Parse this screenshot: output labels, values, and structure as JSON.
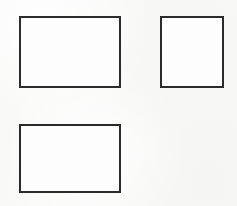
{
  "canvas": {
    "width": 237,
    "height": 206,
    "background_color": "#f8f8f7",
    "description": "Three empty outlined rectangles on a plain off-white background"
  },
  "style": {
    "stroke_color": "#2b2b2b",
    "fill_color": "#fdfdfd",
    "stroke_width_px": 2
  },
  "shapes": [
    {
      "name": "rectangle-top-left",
      "label": "Rectangle 1",
      "x": 19,
      "y": 16,
      "width": 102,
      "height": 72,
      "orientation": "landscape",
      "fill": "#fdfdfd",
      "stroke": "#2b2b2b",
      "stroke_width": 2
    },
    {
      "name": "rectangle-top-right",
      "label": "Rectangle 2",
      "x": 160,
      "y": 16,
      "width": 64,
      "height": 72,
      "orientation": "portrait",
      "fill": "#fdfdfd",
      "stroke": "#2b2b2b",
      "stroke_width": 2
    },
    {
      "name": "rectangle-bottom-left",
      "label": "Rectangle 3",
      "x": 19,
      "y": 124,
      "width": 102,
      "height": 69,
      "orientation": "landscape",
      "fill": "#fdfdfd",
      "stroke": "#2b2b2b",
      "stroke_width": 2
    }
  ]
}
